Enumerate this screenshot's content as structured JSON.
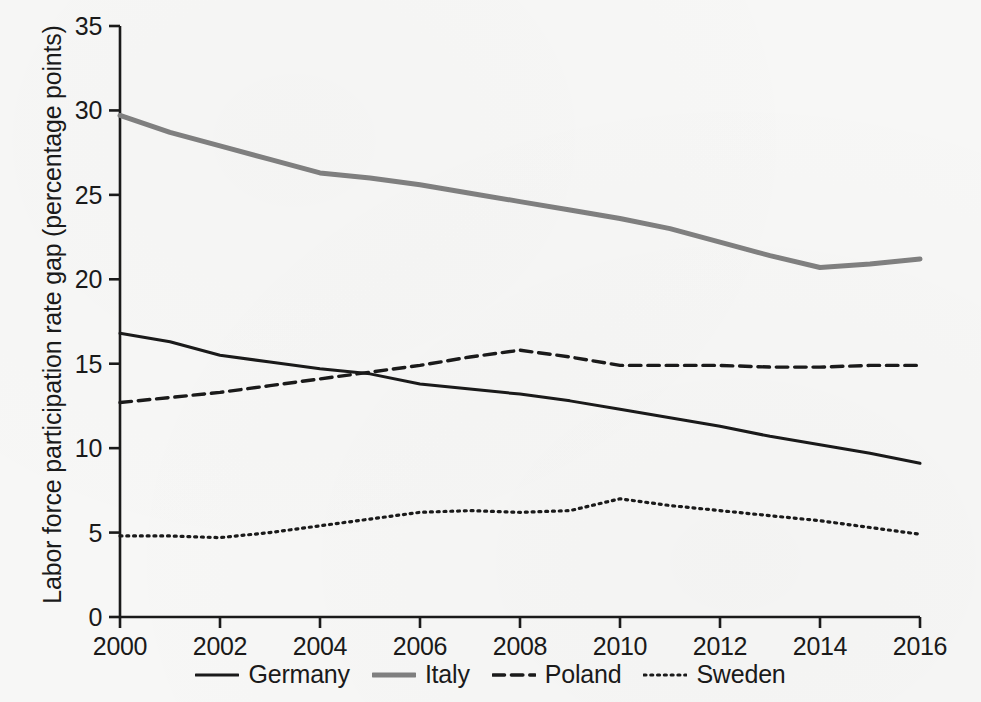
{
  "chart_data": {
    "type": "line",
    "title": "",
    "xlabel": "",
    "ylabel": "Labor force participation rate gap (percentage points)",
    "xlim": [
      2000,
      2016
    ],
    "ylim": [
      0,
      35
    ],
    "xticks": [
      "2000",
      "2002",
      "2004",
      "2006",
      "2008",
      "2010",
      "2012",
      "2014",
      "2016"
    ],
    "yticks": [
      "0",
      "5",
      "10",
      "15",
      "20",
      "25",
      "30",
      "35"
    ],
    "grid": false,
    "legend_position": "bottom",
    "x": [
      2000,
      2001,
      2002,
      2003,
      2004,
      2005,
      2006,
      2007,
      2008,
      2009,
      2010,
      2011,
      2012,
      2013,
      2014,
      2015,
      2016
    ],
    "series": [
      {
        "name": "Germany",
        "style": "solid",
        "color": "#1a1a1a",
        "width": 3,
        "values": [
          16.8,
          16.3,
          15.5,
          15.1,
          14.7,
          14.4,
          13.8,
          13.5,
          13.2,
          12.8,
          12.3,
          11.8,
          11.3,
          10.7,
          10.2,
          9.7,
          9.1
        ]
      },
      {
        "name": "Italy",
        "style": "solid",
        "color": "#808080",
        "width": 5,
        "values": [
          29.7,
          28.7,
          27.9,
          27.1,
          26.3,
          26.0,
          25.6,
          25.1,
          24.6,
          24.1,
          23.6,
          23.0,
          22.2,
          21.4,
          20.7,
          20.9,
          21.2
        ]
      },
      {
        "name": "Poland",
        "style": "dashed",
        "color": "#1a1a1a",
        "width": 3.4,
        "values": [
          12.7,
          13.0,
          13.3,
          13.7,
          14.1,
          14.5,
          14.9,
          15.4,
          15.8,
          15.4,
          14.9,
          14.9,
          14.9,
          14.8,
          14.8,
          14.9,
          14.9
        ]
      },
      {
        "name": "Sweden",
        "style": "dotted",
        "color": "#1a1a1a",
        "width": 3.2,
        "values": [
          4.8,
          4.8,
          4.7,
          5.0,
          5.4,
          5.8,
          6.2,
          6.3,
          6.2,
          6.3,
          7.0,
          6.6,
          6.3,
          6.0,
          5.7,
          5.3,
          4.9
        ]
      }
    ]
  },
  "legend": {
    "items": [
      {
        "label": "Germany"
      },
      {
        "label": "Italy"
      },
      {
        "label": "Poland"
      },
      {
        "label": "Sweden"
      }
    ]
  }
}
